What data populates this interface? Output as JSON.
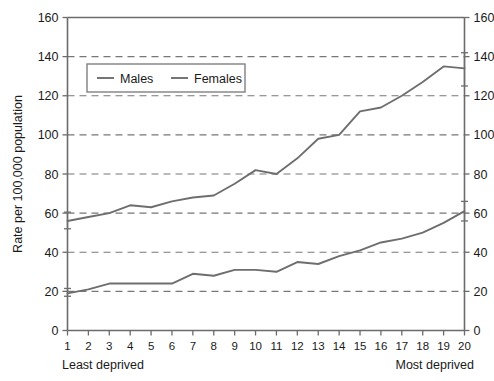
{
  "chart_data": {
    "type": "line",
    "title": "",
    "xlabel": "",
    "ylabel": "Rate per 100,000 population",
    "x_axis_left_annotation": "Least deprived",
    "x_axis_right_annotation": "Most deprived",
    "categories": [
      "1",
      "2",
      "3",
      "4",
      "5",
      "6",
      "7",
      "8",
      "9",
      "10",
      "11",
      "12",
      "13",
      "14",
      "15",
      "16",
      "17",
      "18",
      "19",
      "20"
    ],
    "x": [
      1,
      2,
      3,
      4,
      5,
      6,
      7,
      8,
      9,
      10,
      11,
      12,
      13,
      14,
      15,
      16,
      17,
      18,
      19,
      20
    ],
    "xlim": [
      1,
      20
    ],
    "ylim": [
      0,
      160
    ],
    "y_ticks": [
      0,
      20,
      40,
      60,
      80,
      100,
      120,
      140,
      160
    ],
    "y_ticks_right": [
      0,
      20,
      40,
      60,
      80,
      100,
      120,
      140,
      160
    ],
    "grid": "horizontal-dashed",
    "grid_values": [
      20,
      40,
      60,
      80,
      100,
      120,
      140
    ],
    "legend_position": "top-left-inside",
    "series": [
      {
        "name": "Males",
        "color": "#6e6e6e",
        "values": [
          56,
          58,
          60,
          64,
          63,
          66,
          68,
          69,
          75,
          82,
          80,
          88,
          98,
          100,
          112,
          114,
          120,
          127,
          135,
          134
        ],
        "error_bars": [
          {
            "x": 1,
            "low": 52,
            "high": 60.5
          },
          {
            "x": 20,
            "low": 125,
            "high": 142
          }
        ]
      },
      {
        "name": "Females",
        "color": "#6e6e6e",
        "values": [
          19,
          21,
          24,
          24,
          24,
          24,
          29,
          28,
          31,
          31,
          30,
          35,
          34,
          38,
          41,
          45,
          47,
          50,
          55,
          61
        ],
        "error_bars": [
          {
            "x": 1,
            "low": 17.5,
            "high": 21.5
          },
          {
            "x": 20,
            "low": 56,
            "high": 66
          }
        ]
      }
    ]
  },
  "legend": {
    "items": [
      {
        "label": "Males"
      },
      {
        "label": "Females"
      }
    ]
  },
  "axes": {
    "y_label": "Rate per 100,000 population",
    "y_tick_labels": [
      "0",
      "20",
      "40",
      "60",
      "80",
      "100",
      "120",
      "140",
      "160"
    ],
    "y_tick_labels_right": [
      "0",
      "20",
      "40",
      "60",
      "80",
      "100",
      "120",
      "140",
      "160"
    ],
    "x_tick_labels": [
      "1",
      "2",
      "3",
      "4",
      "5",
      "6",
      "7",
      "8",
      "9",
      "10",
      "11",
      "12",
      "13",
      "14",
      "15",
      "16",
      "17",
      "18",
      "19",
      "20"
    ],
    "left_end_label": "Least deprived",
    "right_end_label": "Most deprived"
  }
}
